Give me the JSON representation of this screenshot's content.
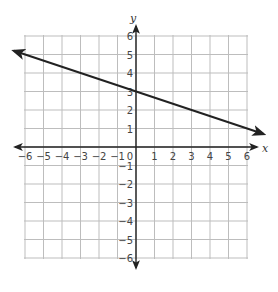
{
  "chart_data": {
    "type": "line",
    "title": "",
    "xlabel": "x",
    "ylabel": "y",
    "xlim": [
      -6,
      6
    ],
    "ylim": [
      -6,
      6
    ],
    "grid": true,
    "x_ticks": [
      "-6",
      "-5",
      "-4",
      "-3",
      "-2",
      "-1",
      "0",
      "1",
      "2",
      "3",
      "4",
      "5",
      "6"
    ],
    "y_ticks": [
      "6",
      "5",
      "4",
      "3",
      "2",
      "1",
      "-1",
      "-2",
      "-3",
      "-4",
      "-5",
      "-6"
    ],
    "series": [
      {
        "name": "line",
        "equation": "y = -1/3 x + 3",
        "points": [
          [
            -6,
            5
          ],
          [
            0,
            3
          ],
          [
            3,
            2
          ],
          [
            6,
            1
          ]
        ],
        "arrows": "both"
      }
    ]
  },
  "colors": {
    "grid": "#bdbdbd",
    "axis": "#222222",
    "line": "#222222"
  }
}
